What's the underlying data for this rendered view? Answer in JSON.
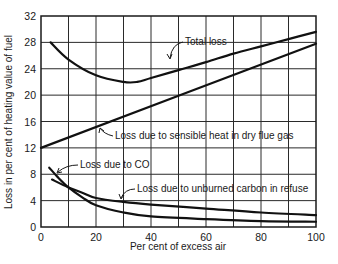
{
  "chart_data": {
    "type": "line",
    "title": "",
    "xlabel": "Per cent of excess air",
    "ylabel": "Loss in per cent of heating value of fuel",
    "xlim": [
      0,
      100
    ],
    "ylim": [
      0,
      32
    ],
    "x_ticks": [
      "0",
      "20",
      "40",
      "60",
      "80",
      "100"
    ],
    "y_ticks": [
      "0",
      "4",
      "8",
      "12",
      "16",
      "20",
      "24",
      "28",
      "32"
    ],
    "grid": true,
    "grid_x_step": 10,
    "grid_y_step": 4,
    "legend": "none (curves labeled directly with arrows)",
    "series": [
      {
        "name": "Total loss",
        "label": "Total loss",
        "x": [
          3.5,
          10,
          20,
          30,
          35,
          40,
          50,
          60,
          70,
          80,
          90,
          100
        ],
        "y": [
          28,
          25.4,
          23,
          22,
          22,
          22.6,
          23.8,
          25,
          26.3,
          27.4,
          28.5,
          29.6
        ]
      },
      {
        "name": "Loss due to sensible heat in dry flue gas",
        "label": "Loss due to sensible heat in dry flue gas",
        "x": [
          0,
          100
        ],
        "y": [
          12,
          27.8
        ]
      },
      {
        "name": "Loss due to CO",
        "label": "Loss due to CO",
        "x": [
          3,
          6,
          10,
          15,
          20,
          30,
          40,
          60,
          80,
          100
        ],
        "y": [
          9,
          7.6,
          6,
          4.5,
          3.3,
          2.2,
          1.6,
          1.2,
          0.9,
          0.8
        ]
      },
      {
        "name": "Loss due to unburned carbon in refuse",
        "label": "Loss due to unburned carbon in refuse",
        "x": [
          4,
          10,
          15,
          20,
          30,
          40,
          60,
          80,
          100
        ],
        "y": [
          7.2,
          6,
          5.2,
          4.4,
          3.8,
          3.4,
          2.8,
          2.2,
          1.8
        ]
      }
    ]
  },
  "labels": {
    "total": "Total loss",
    "sensible": "Loss due to sensible heat in dry flue gas",
    "co": "Loss due to CO",
    "carbon": "Loss due to unburned carbon in refuse"
  },
  "axes": {
    "xlabel": "Per cent of excess air",
    "ylabel": "Loss in per cent of heating value of fuel"
  }
}
